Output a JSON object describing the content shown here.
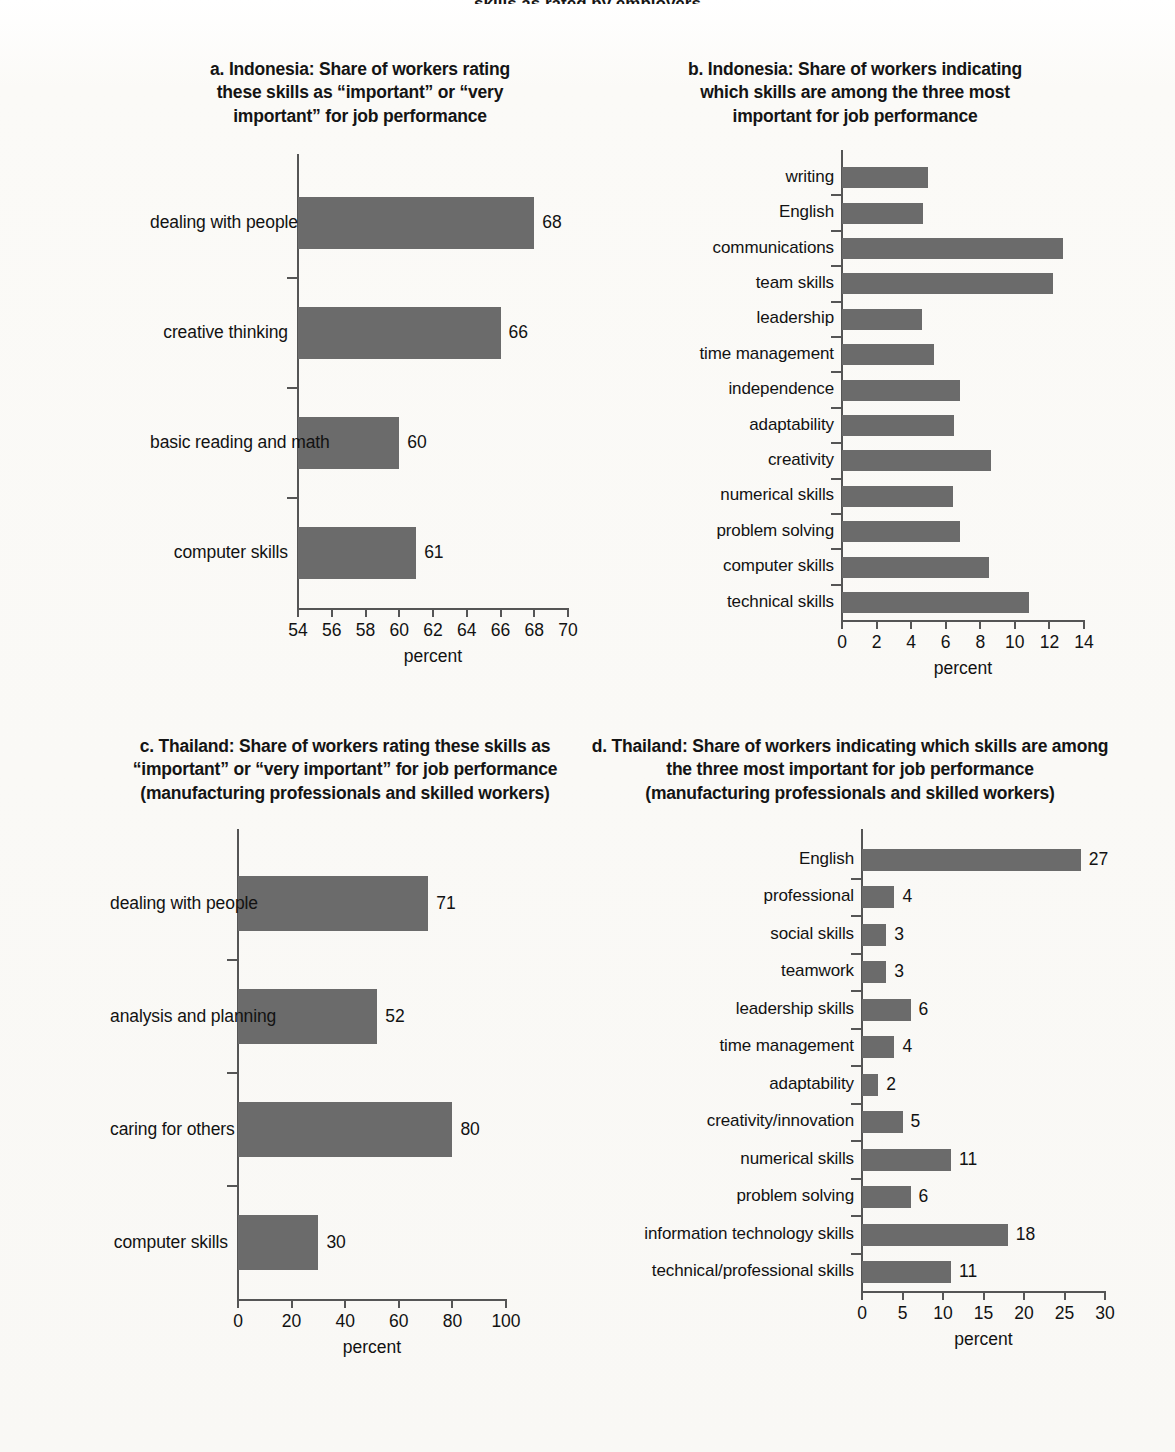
{
  "figure": {
    "cropped_heading": "skills as rated by employers",
    "axis_title": "percent"
  },
  "chart_data": [
    {
      "id": "a",
      "type": "bar",
      "orientation": "horizontal",
      "title": "a. Indonesia: Share of workers rating these skills as “important” or “very important” for job performance",
      "title_lines": [
        "a. Indonesia: Share of workers rating",
        "these skills as “important” or “very",
        "important” for job performance"
      ],
      "categories": [
        "dealing with people",
        "creative thinking",
        "basic reading and math",
        "computer skills"
      ],
      "values": [
        68,
        66,
        60,
        61
      ],
      "value_labels": [
        "68",
        "66",
        "60",
        "61"
      ],
      "xlabel": "percent",
      "ylabel": "",
      "xlim": [
        54,
        70
      ],
      "xticks": [
        54,
        56,
        58,
        60,
        62,
        64,
        66,
        68,
        70
      ],
      "xtick_labels": [
        "54",
        "56",
        "58",
        "60",
        "62",
        "64",
        "66",
        "68",
        "70"
      ],
      "grid": false,
      "legend": "none",
      "bar_color": "#6b6b6b"
    },
    {
      "id": "b",
      "type": "bar",
      "orientation": "horizontal",
      "title": "b. Indonesia: Share of workers indicating which skills are among the three most important for job performance",
      "title_lines": [
        "b. Indonesia: Share of workers indicating",
        "which skills are among the three most",
        "important for job performance"
      ],
      "categories": [
        "writing",
        "English",
        "communications",
        "team skills",
        "leadership",
        "time management",
        "independence",
        "adaptability",
        "creativity",
        "numerical skills",
        "problem solving",
        "computer skills",
        "technical skills"
      ],
      "values": [
        5.0,
        4.7,
        12.8,
        12.2,
        4.6,
        5.3,
        6.8,
        6.5,
        8.6,
        6.4,
        6.8,
        8.5,
        10.8
      ],
      "value_labels": [
        "",
        "",
        "",
        "",
        "",
        "",
        "",
        "",
        "",
        "",
        "",
        "",
        ""
      ],
      "xlabel": "percent",
      "ylabel": "",
      "xlim": [
        0,
        14
      ],
      "xticks": [
        0,
        2,
        4,
        6,
        8,
        10,
        12,
        14
      ],
      "xtick_labels": [
        "0",
        "2",
        "4",
        "6",
        "8",
        "10",
        "12",
        "14"
      ],
      "grid": false,
      "legend": "none",
      "bar_color": "#6b6b6b"
    },
    {
      "id": "c",
      "type": "bar",
      "orientation": "horizontal",
      "title": "c. Thailand: Share of workers rating these skills as “important” or “very important” for job performance (manufacturing professionals and skilled workers)",
      "title_lines": [
        "c. Thailand: Share of workers rating these skills as",
        "“important” or “very important” for job performance",
        "(manufacturing professionals and skilled workers)"
      ],
      "categories": [
        "dealing with people",
        "analysis and planning",
        "caring for others",
        "computer skills"
      ],
      "values": [
        71,
        52,
        80,
        30
      ],
      "value_labels": [
        "71",
        "52",
        "80",
        "30"
      ],
      "xlabel": "percent",
      "ylabel": "",
      "xlim": [
        0,
        100
      ],
      "xticks": [
        0,
        20,
        40,
        60,
        80,
        100
      ],
      "xtick_labels": [
        "0",
        "20",
        "40",
        "60",
        "80",
        "100"
      ],
      "grid": false,
      "legend": "none",
      "bar_color": "#6b6b6b"
    },
    {
      "id": "d",
      "type": "bar",
      "orientation": "horizontal",
      "title": "d. Thailand: Share of workers indicating which skills are among the three most important for job performance (manufacturing professionals and skilled workers)",
      "title_lines": [
        "d. Thailand: Share of workers indicating which skills are among",
        "the three most important for job performance",
        "(manufacturing professionals and skilled workers)"
      ],
      "categories": [
        "English",
        "professional",
        "social skills",
        "teamwork",
        "leadership skills",
        "time management",
        "adaptability",
        "creativity/innovation",
        "numerical skills",
        "problem solving",
        "information technology skills",
        "technical/professional skills"
      ],
      "values": [
        27,
        4,
        3,
        3,
        6,
        4,
        2,
        5,
        11,
        6,
        18,
        11
      ],
      "value_labels": [
        "27",
        "4",
        "3",
        "3",
        "6",
        "4",
        "2",
        "5",
        "11",
        "6",
        "18",
        "11"
      ],
      "xlabel": "percent",
      "ylabel": "",
      "xlim": [
        0,
        30
      ],
      "xticks": [
        0,
        5,
        10,
        15,
        20,
        25,
        30
      ],
      "xtick_labels": [
        "0",
        "5",
        "10",
        "15",
        "20",
        "25",
        "30"
      ],
      "grid": false,
      "legend": "none",
      "bar_color": "#6b6b6b"
    }
  ]
}
